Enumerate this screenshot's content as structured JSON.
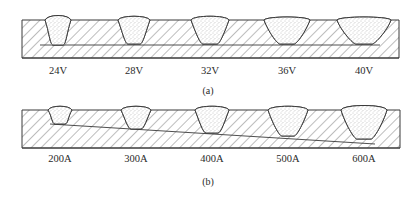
{
  "figure": {
    "panel_a": {
      "caption": "(a)",
      "variable": "arc voltage",
      "plate": {
        "x1": 22,
        "x2": 399,
        "top": 20,
        "bottom": 58
      },
      "inner_line": {
        "x1": 40,
        "y1": 45,
        "x2": 380,
        "y2": 45
      },
      "beads": [
        {
          "label": "24V",
          "cx": 58,
          "half_top": 11,
          "half_bot": 5,
          "depth": 25,
          "crown": 5
        },
        {
          "label": "28V",
          "cx": 134,
          "half_top": 14,
          "half_bot": 6,
          "depth": 24,
          "crown": 4
        },
        {
          "label": "32V",
          "cx": 210,
          "half_top": 17,
          "half_bot": 7,
          "depth": 24,
          "crown": 4
        },
        {
          "label": "36V",
          "cx": 287,
          "half_top": 21,
          "half_bot": 7,
          "depth": 24,
          "crown": 3
        },
        {
          "label": "40V",
          "cx": 364,
          "half_top": 25,
          "half_bot": 8,
          "depth": 24,
          "crown": 3
        }
      ],
      "label_y": 74,
      "caption_pos": {
        "x": 208,
        "y": 94
      }
    },
    "panel_b": {
      "caption": "(b)",
      "variable": "welding current",
      "plate": {
        "x1": 22,
        "x2": 400,
        "top": 110,
        "bottom": 148
      },
      "inner_line": {
        "x1": 50,
        "y1": 124,
        "x2": 375,
        "y2": 144
      },
      "beads": [
        {
          "label": "200A",
          "cx": 60,
          "half_top": 10,
          "half_bot": 5,
          "depth": 14,
          "crown": 4
        },
        {
          "label": "300A",
          "cx": 136,
          "half_top": 13,
          "half_bot": 5,
          "depth": 19,
          "crown": 4
        },
        {
          "label": "400A",
          "cx": 212,
          "half_top": 15,
          "half_bot": 6,
          "depth": 23,
          "crown": 4
        },
        {
          "label": "500A",
          "cx": 288,
          "half_top": 18,
          "half_bot": 6,
          "depth": 26,
          "crown": 4
        },
        {
          "label": "600A",
          "cx": 364,
          "half_top": 21,
          "half_bot": 7,
          "depth": 29,
          "crown": 5
        }
      ],
      "label_y": 162,
      "caption_pos": {
        "x": 208,
        "y": 185
      }
    },
    "colors": {
      "line": "#3a3a3a",
      "hatch": "#5a5a5a",
      "stipple": "#8a8a8a",
      "text": "#2a2a2a"
    }
  }
}
